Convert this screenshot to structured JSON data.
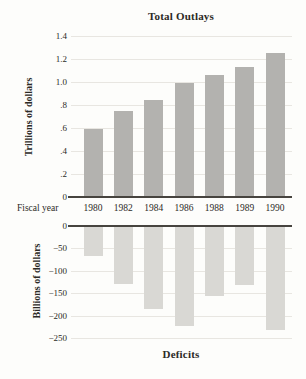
{
  "figure_name": "Federal budget figure",
  "axis": {
    "fiscal_year_label": "Fiscal year"
  },
  "colors": {
    "background": "#fdfdfb",
    "outlays_bar": "#b3b2af",
    "deficit_bar": "#d9d8d4",
    "gridline": "#e8e6e1",
    "axis_line": "#47443f",
    "text": "#2c2a26"
  },
  "chart_data": [
    {
      "type": "bar",
      "title": "Total Outlays",
      "ylabel": "Trillions of dollars",
      "xlabel": "Fiscal year",
      "categories": [
        "1980",
        "1982",
        "1984",
        "1986",
        "1988",
        "1989",
        "1990"
      ],
      "values": [
        0.59,
        0.75,
        0.84,
        0.99,
        1.06,
        1.13,
        1.25
      ],
      "ylim": [
        0,
        1.4
      ],
      "yticks": [
        1.4,
        1.2,
        1.0,
        0.8,
        0.6,
        0.4,
        0.2,
        0
      ],
      "ytick_labels": [
        "1.4",
        "1.2",
        "1.0",
        ".8",
        ".6",
        ".4",
        ".2",
        "0"
      ],
      "grid": true,
      "legend": "none",
      "bar_color": "#b3b2af"
    },
    {
      "type": "bar",
      "title": "Deficits",
      "ylabel": "Billions of dollars",
      "xlabel": "Fiscal year",
      "categories": [
        "1980",
        "1982",
        "1984",
        "1986",
        "1988",
        "1989",
        "1990"
      ],
      "values": [
        -65,
        -128,
        -185,
        -221,
        -155,
        -130,
        -230
      ],
      "ylim": [
        -250,
        0
      ],
      "yticks": [
        0,
        -50,
        -100,
        -150,
        -200,
        -250
      ],
      "ytick_labels": [
        "0",
        "−50",
        "−100",
        "−150",
        "−200",
        "−250"
      ],
      "grid": true,
      "legend": "none",
      "bar_color": "#d9d8d4"
    }
  ]
}
